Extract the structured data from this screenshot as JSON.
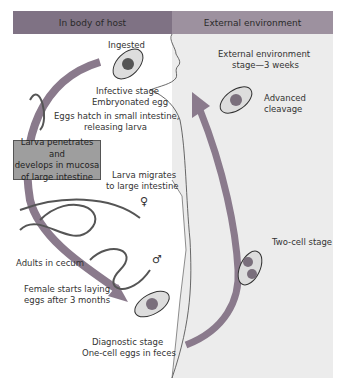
{
  "header": {
    "left": "In body of host",
    "right": "External environment"
  },
  "labels": {
    "ingested": "Ingested",
    "infective_line1": "Infective stage",
    "infective_line2": "Embryonated egg",
    "hatch_line1": "Eggs hatch in small intestine,",
    "hatch_line2": "releasing larva",
    "mucosa_line1": "Larva penetrates and",
    "mucosa_line2": "develops in mucosa",
    "mucosa_line3": "of large intestine",
    "migrates_line1": "Larva migrates",
    "migrates_line2": "to large intestine",
    "female_symbol": "♀",
    "male_symbol": "♂",
    "adults": "Adults in cecum",
    "laying_line1": "Female starts laying",
    "laying_line2": "eggs after 3 months",
    "diagnostic_line1": "Diagnostic stage",
    "diagnostic_line2": "One-cell eggs in feces",
    "two_cell": "Two-cell stage",
    "advanced_line1": "Advanced",
    "advanced_line2": "cleavage",
    "ext_stage_line1": "External environment",
    "ext_stage_line2": "stage—3 weeks"
  },
  "colors": {
    "header_left": "#7f7284",
    "header_right": "#9d919f",
    "external_panel": "#ececec",
    "arrow": "#8a7a8c",
    "box": "#9e9e9e"
  }
}
